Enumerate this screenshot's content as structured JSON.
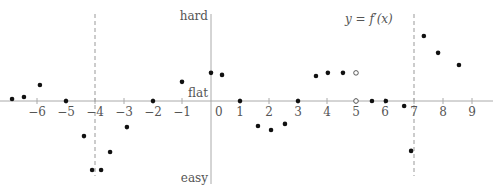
{
  "chart_data": {
    "type": "scatter",
    "title": "y = f′(x)",
    "xlabel": "",
    "ylabel": "",
    "y_axis_labels": {
      "top": "hard",
      "middle": "flat",
      "bottom": "easy"
    },
    "xlim": [
      -7.2,
      9.6
    ],
    "ylim": [
      -2.9,
      3.0
    ],
    "x_ticks": [
      -6,
      -5,
      -4,
      -3,
      -2,
      -1,
      0,
      1,
      2,
      3,
      4,
      5,
      6,
      7,
      8,
      9
    ],
    "tick_labels": [
      "−6",
      "−5",
      "−4",
      "−3",
      "−2",
      "−1",
      "0",
      "1",
      "2",
      "3",
      "4",
      "5",
      "6",
      "7",
      "8",
      "9"
    ],
    "dashed_vertical_lines": [
      -4,
      7
    ],
    "grid": false,
    "legend": null,
    "filled_points": [
      {
        "x": -6.86,
        "y": 0.07
      },
      {
        "x": -6.45,
        "y": 0.14
      },
      {
        "x": -5.9,
        "y": 0.55
      },
      {
        "x": -5.0,
        "y": 0.0
      },
      {
        "x": -4.38,
        "y": -1.21
      },
      {
        "x": -4.1,
        "y": -2.38
      },
      {
        "x": -3.79,
        "y": -2.38
      },
      {
        "x": -3.48,
        "y": -1.76
      },
      {
        "x": -2.9,
        "y": -0.9
      },
      {
        "x": -2.0,
        "y": 0.0
      },
      {
        "x": -1.0,
        "y": 0.66
      },
      {
        "x": 0.0,
        "y": 0.97
      },
      {
        "x": 0.38,
        "y": 0.9
      },
      {
        "x": 1.0,
        "y": 0.0
      },
      {
        "x": 1.62,
        "y": -0.86
      },
      {
        "x": 2.07,
        "y": -1.0
      },
      {
        "x": 2.55,
        "y": -0.79
      },
      {
        "x": 3.0,
        "y": 0.0
      },
      {
        "x": 3.62,
        "y": 0.86
      },
      {
        "x": 4.03,
        "y": 0.97
      },
      {
        "x": 4.55,
        "y": 0.97
      },
      {
        "x": 5.55,
        "y": 0.0
      },
      {
        "x": 6.03,
        "y": 0.0
      },
      {
        "x": 6.66,
        "y": -0.17
      },
      {
        "x": 6.9,
        "y": -1.72
      },
      {
        "x": 7.34,
        "y": 2.24
      },
      {
        "x": 7.83,
        "y": 1.66
      },
      {
        "x": 8.55,
        "y": 1.24
      }
    ],
    "open_points": [
      {
        "x": 5.0,
        "y": 0.97
      },
      {
        "x": 5.0,
        "y": 0.0
      }
    ]
  }
}
